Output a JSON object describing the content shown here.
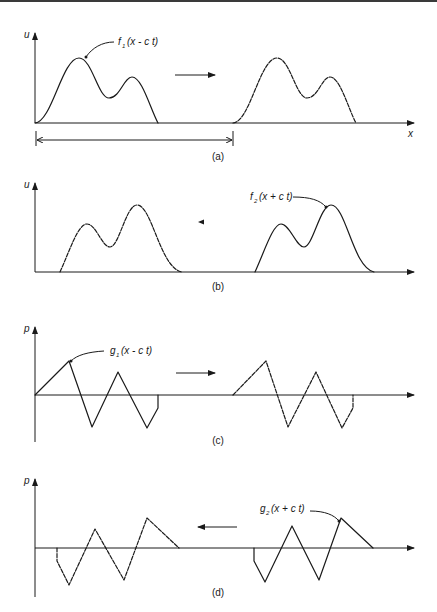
{
  "figure": {
    "panels": [
      {
        "id": "a",
        "caption": "(a)",
        "y_axis_label": "u",
        "x_axis_label": "x",
        "curve_label": {
          "func": "f",
          "sub": "1",
          "args": "(x - c t)"
        },
        "travel_direction": "right"
      },
      {
        "id": "b",
        "caption": "(b)",
        "y_axis_label": "u",
        "curve_label": {
          "func": "f",
          "sub": "2",
          "args": "(x + c t)"
        },
        "travel_direction": "left"
      },
      {
        "id": "c",
        "caption": "(c)",
        "y_axis_label": "p",
        "curve_label": {
          "func": "g",
          "sub": "1",
          "args": "(x - c t)"
        },
        "travel_direction": "right"
      },
      {
        "id": "d",
        "caption": "(d)",
        "y_axis_label": "p",
        "curve_label": {
          "func": "g",
          "sub": "2",
          "args": "(x + c t)"
        },
        "travel_direction": "left"
      }
    ],
    "colors": {
      "ink": "#1a1a1a",
      "background": "#ffffff",
      "top_rule": "#3a3a3a"
    }
  }
}
